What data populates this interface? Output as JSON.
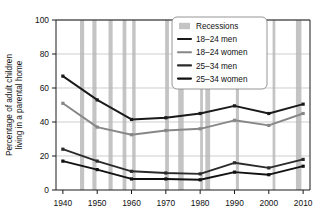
{
  "chart_data": {
    "type": "line",
    "title": "",
    "xlabel": "",
    "ylabel": "Percentage of adult children living in a parental home",
    "x": [
      1940,
      1950,
      1960,
      1970,
      1980,
      1990,
      2000,
      2010
    ],
    "xlim": [
      1938,
      2012
    ],
    "ylim": [
      0,
      100
    ],
    "xticks": [
      "1940",
      "1950",
      "1960",
      "1970",
      "1980",
      "1990",
      "2000",
      "2010"
    ],
    "yticks": [
      "0",
      "20",
      "40",
      "60",
      "80",
      "100"
    ],
    "grid": "horizontal",
    "legend_position": "upper-right",
    "series": [
      {
        "name": "18–24 men",
        "color": "#1a1a1a",
        "values": [
          67,
          53,
          41.5,
          42.5,
          45,
          49.5,
          45,
          50.5
        ]
      },
      {
        "name": "18–24 women",
        "color": "#878787",
        "values": [
          51,
          37,
          32.5,
          35,
          36,
          41,
          38,
          45
        ]
      },
      {
        "name": "25–34 men",
        "color": "#2b2b2b",
        "values": [
          24,
          17,
          11,
          10,
          9.5,
          16,
          13,
          18
        ]
      },
      {
        "name": "25–34 women",
        "color": "#111111",
        "values": [
          17,
          12,
          6.5,
          6.5,
          6,
          10.5,
          9,
          14
        ]
      }
    ],
    "recessions": {
      "label": "Recessions",
      "color": "#c4c4c4",
      "bands": [
        [
          1945.0,
          1946.2
        ],
        [
          1948.6,
          1949.8
        ],
        [
          1953.3,
          1954.5
        ],
        [
          1957.4,
          1958.5
        ],
        [
          1960.2,
          1961.2
        ],
        [
          1969.8,
          1970.9
        ],
        [
          1973.6,
          1975.2
        ],
        [
          1980.0,
          1980.8
        ],
        [
          1981.5,
          1982.9
        ],
        [
          1990.4,
          1991.3
        ],
        [
          2001.1,
          2001.9
        ],
        [
          2007.9,
          2009.5
        ]
      ]
    }
  },
  "legend": {
    "entries": [
      {
        "label": "Recessions",
        "marker": "swatch"
      },
      {
        "label": "18–24 men",
        "marker": "line"
      },
      {
        "label": "18–24 women",
        "marker": "line"
      },
      {
        "label": "25–34 men",
        "marker": "line"
      },
      {
        "label": "25–34 women",
        "marker": "line"
      }
    ]
  }
}
